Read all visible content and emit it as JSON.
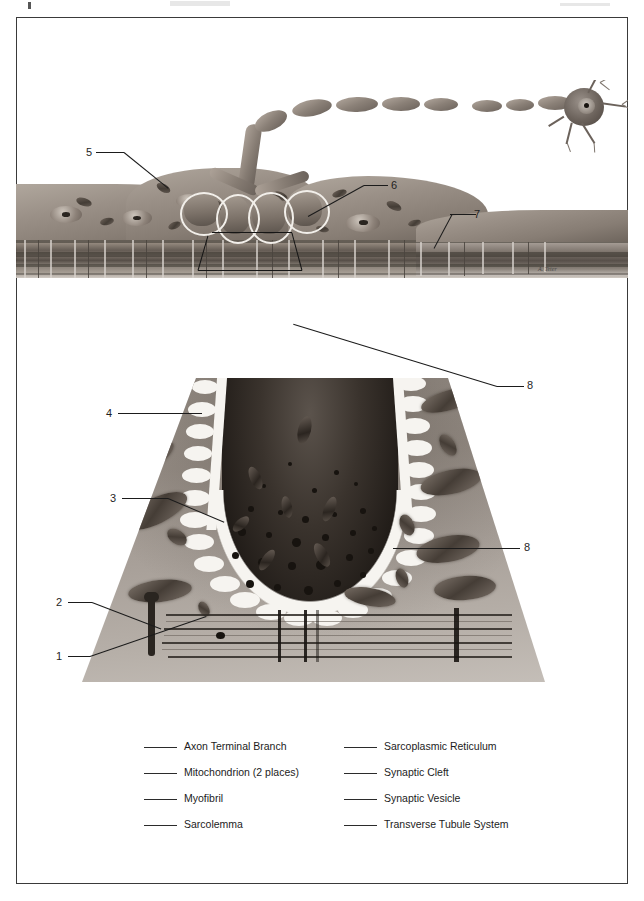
{
  "figure": {
    "frame_color": "#3a3a3a",
    "artist_signature": "A. Teter"
  },
  "callouts": [
    {
      "id": "c5",
      "number": "5",
      "panel": "top",
      "target": "Sarcolemma"
    },
    {
      "id": "c6",
      "number": "6",
      "panel": "top",
      "target": "Synaptic Cleft"
    },
    {
      "id": "c7",
      "number": "7",
      "panel": "top",
      "target": "Transverse Tubule System"
    },
    {
      "id": "c4",
      "number": "4",
      "panel": "bottom",
      "target": "Synaptic Cleft"
    },
    {
      "id": "c8a",
      "number": "8",
      "panel": "bottom",
      "target": "Mitochondrion (2 places)"
    },
    {
      "id": "c3",
      "number": "3",
      "panel": "bottom",
      "target": "Sarcoplasmic Reticulum"
    },
    {
      "id": "c8b",
      "number": "8",
      "panel": "bottom",
      "target": "Mitochondrion (2 places)"
    },
    {
      "id": "c2",
      "number": "2",
      "panel": "bottom",
      "target": "Transverse Tubule System"
    },
    {
      "id": "c1",
      "number": "1",
      "panel": "bottom",
      "target": "Myofibril"
    }
  ],
  "legend": {
    "left_column": [
      {
        "label": "Axon Terminal Branch"
      },
      {
        "label": "Mitochondrion (2 places)"
      },
      {
        "label": "Myofibril"
      },
      {
        "label": "Sarcolemma"
      }
    ],
    "right_column": [
      {
        "label": "Sarcoplasmic Reticulum"
      },
      {
        "label": "Synaptic Cleft"
      },
      {
        "label": "Synaptic Vesicle"
      },
      {
        "label": "Transverse Tubule System"
      }
    ]
  }
}
